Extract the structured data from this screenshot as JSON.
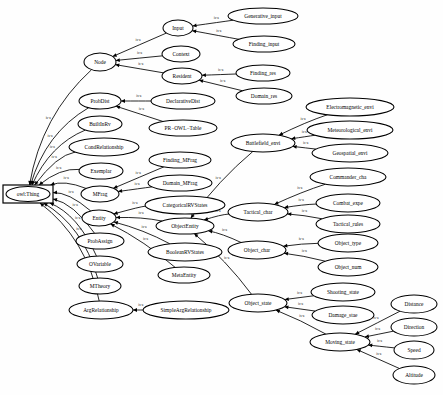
{
  "diagram": {
    "type": "directed-graph",
    "edge_label": "is-a",
    "colors": {
      "node_fill": "#ffffff",
      "node_stroke": "#000000",
      "edge_stroke": "#000000",
      "label_text": "#000000",
      "background": "#ffffff"
    },
    "root": {
      "id": "owl_thing",
      "label": "owl:Thing",
      "shape": "rect",
      "x": 28,
      "y": 194,
      "rx": 25,
      "ry": 9
    },
    "nodes": [
      {
        "id": "node",
        "label": "Node",
        "x": 100,
        "y": 62,
        "rx": 16,
        "ry": 9
      },
      {
        "id": "input",
        "label": "Input",
        "x": 178,
        "y": 28,
        "rx": 15,
        "ry": 8
      },
      {
        "id": "context",
        "label": "Context",
        "x": 181,
        "y": 54,
        "rx": 19,
        "ry": 8
      },
      {
        "id": "resident",
        "label": "Resident",
        "x": 182,
        "y": 76,
        "rx": 20,
        "ry": 8
      },
      {
        "id": "generative_input",
        "label": "Generative_input",
        "x": 263,
        "y": 16,
        "rx": 35,
        "ry": 8
      },
      {
        "id": "finding_input",
        "label": "Finding_input",
        "x": 264,
        "y": 44,
        "rx": 31,
        "ry": 8
      },
      {
        "id": "finding_res",
        "label": "Finding_res",
        "x": 263,
        "y": 73,
        "rx": 27,
        "ry": 8
      },
      {
        "id": "domain_res",
        "label": "Domain_res",
        "x": 264,
        "y": 96,
        "rx": 28,
        "ry": 8
      },
      {
        "id": "probdist",
        "label": "ProbDist",
        "x": 100,
        "y": 101,
        "rx": 21,
        "ry": 8
      },
      {
        "id": "declarativedist",
        "label": "DeclarativeDist",
        "x": 183,
        "y": 101,
        "rx": 32,
        "ry": 8
      },
      {
        "id": "pr_owl_table",
        "label": "PR−OWL−Table",
        "x": 183,
        "y": 128,
        "rx": 34,
        "ry": 8
      },
      {
        "id": "builtinrv",
        "label": "BuiltInRv",
        "x": 100,
        "y": 124,
        "rx": 22,
        "ry": 8
      },
      {
        "id": "condrelationship",
        "label": "CondRelationship",
        "x": 104,
        "y": 147,
        "rx": 35,
        "ry": 9
      },
      {
        "id": "exemplar",
        "label": "Exemplar",
        "x": 101,
        "y": 171,
        "rx": 22,
        "ry": 8
      },
      {
        "id": "mfrag",
        "label": "MFrag",
        "x": 100,
        "y": 194,
        "rx": 19,
        "ry": 8
      },
      {
        "id": "finding_mfrag",
        "label": "Finding_MFrag",
        "x": 180,
        "y": 160,
        "rx": 31,
        "ry": 8
      },
      {
        "id": "domain_mfrag",
        "label": "Domain_MFrag",
        "x": 180,
        "y": 183,
        "rx": 32,
        "ry": 8
      },
      {
        "id": "entity",
        "label": "Entity",
        "x": 99,
        "y": 218,
        "rx": 17,
        "ry": 8
      },
      {
        "id": "categoricalrvstate",
        "label": "CategoricalRVStates",
        "x": 185,
        "y": 205,
        "rx": 40,
        "ry": 9
      },
      {
        "id": "objectentity",
        "label": "ObjectEntity",
        "x": 185,
        "y": 226,
        "rx": 29,
        "ry": 8
      },
      {
        "id": "booleanrvstate",
        "label": "BooleanRVStates",
        "x": 185,
        "y": 252,
        "rx": 37,
        "ry": 9
      },
      {
        "id": "metaentity",
        "label": "MetaEntity",
        "x": 184,
        "y": 275,
        "rx": 26,
        "ry": 8
      },
      {
        "id": "probassign",
        "label": "ProbAssign",
        "x": 100,
        "y": 241,
        "rx": 24,
        "ry": 8
      },
      {
        "id": "ovariable",
        "label": "OVariable",
        "x": 100,
        "y": 264,
        "rx": 23,
        "ry": 8
      },
      {
        "id": "mtheory",
        "label": "MTheory",
        "x": 100,
        "y": 286,
        "rx": 21,
        "ry": 8
      },
      {
        "id": "argrelationship",
        "label": "ArgRelationship",
        "x": 101,
        "y": 310,
        "rx": 32,
        "ry": 9
      },
      {
        "id": "simplearg",
        "label": "SimpleArgRelationship",
        "x": 186,
        "y": 310,
        "rx": 43,
        "ry": 9
      },
      {
        "id": "battlefield_envi",
        "label": "Battlefield_envi",
        "x": 263,
        "y": 143,
        "rx": 32,
        "ry": 9
      },
      {
        "id": "electromagnetic",
        "label": "Electromagnetic_envi",
        "x": 350,
        "y": 107,
        "rx": 44,
        "ry": 9
      },
      {
        "id": "meteorological",
        "label": "Meteorological_envi",
        "x": 350,
        "y": 130,
        "rx": 43,
        "ry": 9
      },
      {
        "id": "geospatial",
        "label": "Geospatial_envi",
        "x": 350,
        "y": 153,
        "rx": 38,
        "ry": 9
      },
      {
        "id": "tactical_char",
        "label": "Tactical_char",
        "x": 258,
        "y": 212,
        "rx": 30,
        "ry": 9
      },
      {
        "id": "commander_cha",
        "label": "Commander_cha",
        "x": 348,
        "y": 177,
        "rx": 38,
        "ry": 9
      },
      {
        "id": "combat_expe",
        "label": "Combat_expe",
        "x": 348,
        "y": 203,
        "rx": 32,
        "ry": 9
      },
      {
        "id": "tactical_rules",
        "label": "Tactical_rules",
        "x": 348,
        "y": 224,
        "rx": 32,
        "ry": 9
      },
      {
        "id": "object_char",
        "label": "Object_char",
        "x": 257,
        "y": 250,
        "rx": 29,
        "ry": 9
      },
      {
        "id": "object_type",
        "label": "Object_type",
        "x": 348,
        "y": 243,
        "rx": 30,
        "ry": 9
      },
      {
        "id": "object_num",
        "label": "Object_num",
        "x": 348,
        "y": 267,
        "rx": 30,
        "ry": 9
      },
      {
        "id": "object_state",
        "label": "Object_state",
        "x": 258,
        "y": 303,
        "rx": 29,
        "ry": 9
      },
      {
        "id": "shooting_state",
        "label": "Shooting_state",
        "x": 343,
        "y": 292,
        "rx": 32,
        "ry": 9
      },
      {
        "id": "damage_stae",
        "label": "Damage_stae",
        "x": 343,
        "y": 315,
        "rx": 31,
        "ry": 9
      },
      {
        "id": "moving_state",
        "label": "Moving_state",
        "x": 340,
        "y": 342,
        "rx": 30,
        "ry": 9
      },
      {
        "id": "distance",
        "label": "Distance",
        "x": 414,
        "y": 304,
        "rx": 23,
        "ry": 9
      },
      {
        "id": "direction",
        "label": "Direction",
        "x": 414,
        "y": 327,
        "rx": 23,
        "ry": 9
      },
      {
        "id": "speed",
        "label": "Speed",
        "x": 414,
        "y": 350,
        "rx": 20,
        "ry": 9
      },
      {
        "id": "altitude",
        "label": "Altitude",
        "x": 414,
        "y": 375,
        "rx": 21,
        "ry": 9
      }
    ],
    "edges": [
      {
        "from": "node",
        "to": "owl_thing",
        "label": "is-a"
      },
      {
        "from": "probdist",
        "to": "owl_thing",
        "label": "is-a"
      },
      {
        "from": "builtinrv",
        "to": "owl_thing",
        "label": "is-a"
      },
      {
        "from": "condrelationship",
        "to": "owl_thing",
        "label": "is-a"
      },
      {
        "from": "exemplar",
        "to": "owl_thing",
        "label": "is-a"
      },
      {
        "from": "mfrag",
        "to": "owl_thing",
        "label": "is-a"
      },
      {
        "from": "entity",
        "to": "owl_thing",
        "label": "is-a"
      },
      {
        "from": "probassign",
        "to": "owl_thing",
        "label": "is-a"
      },
      {
        "from": "ovariable",
        "to": "owl_thing",
        "label": "is-a"
      },
      {
        "from": "mtheory",
        "to": "owl_thing",
        "label": "is-a"
      },
      {
        "from": "argrelationship",
        "to": "owl_thing",
        "label": "is-a"
      },
      {
        "from": "input",
        "to": "node",
        "label": "is-a"
      },
      {
        "from": "context",
        "to": "node",
        "label": "is-a"
      },
      {
        "from": "resident",
        "to": "node",
        "label": "is-a"
      },
      {
        "from": "generative_input",
        "to": "input",
        "label": "is-a"
      },
      {
        "from": "finding_input",
        "to": "input",
        "label": "is-a"
      },
      {
        "from": "finding_res",
        "to": "resident",
        "label": "is-a"
      },
      {
        "from": "domain_res",
        "to": "resident",
        "label": "is-a"
      },
      {
        "from": "declarativedist",
        "to": "probdist",
        "label": "is-a"
      },
      {
        "from": "pr_owl_table",
        "to": "probdist",
        "label": "is-a"
      },
      {
        "from": "finding_mfrag",
        "to": "mfrag",
        "label": "is-a"
      },
      {
        "from": "domain_mfrag",
        "to": "mfrag",
        "label": "is-a"
      },
      {
        "from": "categoricalrvstate",
        "to": "entity",
        "label": "is-a"
      },
      {
        "from": "objectentity",
        "to": "entity",
        "label": "is-a"
      },
      {
        "from": "booleanrvstate",
        "to": "entity",
        "label": "is-a"
      },
      {
        "from": "metaentity",
        "to": "entity",
        "label": "is-a"
      },
      {
        "from": "simplearg",
        "to": "argrelationship",
        "label": "is-a"
      },
      {
        "from": "battlefield_envi",
        "to": "objectentity",
        "label": "is-a"
      },
      {
        "from": "tactical_char",
        "to": "objectentity",
        "label": "is-a"
      },
      {
        "from": "object_char",
        "to": "objectentity",
        "label": "is-a"
      },
      {
        "from": "object_state",
        "to": "objectentity",
        "label": "is-a"
      },
      {
        "from": "electromagnetic",
        "to": "battlefield_envi",
        "label": "is-a"
      },
      {
        "from": "meteorological",
        "to": "battlefield_envi",
        "label": "is-a"
      },
      {
        "from": "geospatial",
        "to": "battlefield_envi",
        "label": "is-a"
      },
      {
        "from": "commander_cha",
        "to": "tactical_char",
        "label": "is-a"
      },
      {
        "from": "combat_expe",
        "to": "tactical_char",
        "label": "is-a"
      },
      {
        "from": "tactical_rules",
        "to": "tactical_char",
        "label": "is-a"
      },
      {
        "from": "object_type",
        "to": "object_char",
        "label": "is-a"
      },
      {
        "from": "object_num",
        "to": "object_char",
        "label": "is-a"
      },
      {
        "from": "shooting_state",
        "to": "object_state",
        "label": "is-a"
      },
      {
        "from": "damage_stae",
        "to": "object_state",
        "label": "is-a"
      },
      {
        "from": "moving_state",
        "to": "object_state",
        "label": "is-a"
      },
      {
        "from": "distance",
        "to": "moving_state",
        "label": "is-a"
      },
      {
        "from": "direction",
        "to": "moving_state",
        "label": "is-a"
      },
      {
        "from": "speed",
        "to": "moving_state",
        "label": "is-a"
      },
      {
        "from": "altitude",
        "to": "moving_state",
        "label": "is-a"
      }
    ]
  }
}
